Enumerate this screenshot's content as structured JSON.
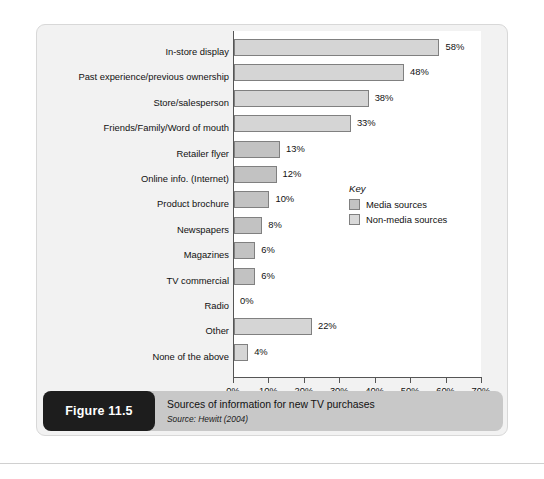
{
  "figure": {
    "badge_label": "Figure 11.5",
    "caption_title": "Sources of information for new TV purchases",
    "caption_source": "Source: Hewitt (2004)"
  },
  "legend": {
    "title": "Key",
    "items": [
      {
        "label": "Media sources",
        "color": "#c2c2c2",
        "type": "media"
      },
      {
        "label": "Non-media sources",
        "color": "#d9d9d9",
        "type": "nonmedia"
      }
    ]
  },
  "chart_data": {
    "type": "bar",
    "orientation": "horizontal",
    "title": "Sources of information for new TV purchases",
    "xlabel": "",
    "ylabel": "",
    "xlim": [
      0,
      70
    ],
    "xticks": [
      "0%",
      "10%",
      "20%",
      "30%",
      "40%",
      "50%",
      "60%",
      "70%"
    ],
    "xtick_values": [
      0,
      10,
      20,
      30,
      40,
      50,
      60,
      70
    ],
    "grid": false,
    "legend_position": "inside-right",
    "value_suffix": "%",
    "categories": [
      "In-store display",
      "Past experience/previous ownership",
      "Store/salesperson",
      "Friends/Family/Word of mouth",
      "Retailer flyer",
      "Online info. (Internet)",
      "Product brochure",
      "Newspapers",
      "Magazines",
      "TV commercial",
      "Radio",
      "Other",
      "None of the above"
    ],
    "values": [
      58,
      48,
      38,
      33,
      13,
      12,
      10,
      8,
      6,
      6,
      0,
      22,
      4
    ],
    "value_labels": [
      "58%",
      "48%",
      "38%",
      "33%",
      "13%",
      "12%",
      "10%",
      "8%",
      "6%",
      "6%",
      "0%",
      "22%",
      "4%"
    ],
    "series_group": [
      "nonmedia",
      "nonmedia",
      "nonmedia",
      "nonmedia",
      "media",
      "media",
      "media",
      "media",
      "media",
      "media",
      "media",
      "nonmedia",
      "nonmedia"
    ]
  }
}
